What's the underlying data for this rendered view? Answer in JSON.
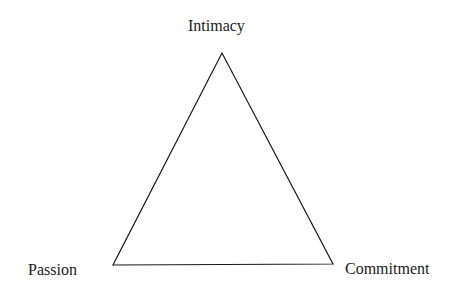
{
  "diagram": {
    "type": "triangle",
    "vertices": {
      "top": {
        "label": "Intimacy"
      },
      "bottom_left": {
        "label": "Passion"
      },
      "bottom_right": {
        "label": "Commitment"
      }
    },
    "colors": {
      "stroke": "#1a1a1a",
      "background": "#ffffff",
      "text": "#1a1a1a"
    }
  }
}
